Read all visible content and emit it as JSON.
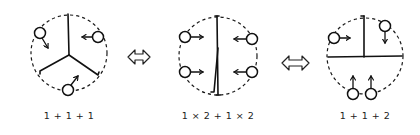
{
  "figure": {
    "colors": {
      "ink": "#111111",
      "background": "#ffffff"
    },
    "panels": [
      {
        "id": "panel-1",
        "label": "1 + 1 + 1",
        "partition": "three sectors (Y-shaped walls)",
        "agents": [
          {
            "x": 40,
            "y": 33,
            "direction": "down-right"
          },
          {
            "x": 98,
            "y": 37,
            "direction": "left"
          },
          {
            "x": 68,
            "y": 90,
            "direction": "up-right"
          }
        ]
      },
      {
        "id": "panel-2",
        "label": "1 × 2 + 1 × 2",
        "partition": "two halves (vertical wall)",
        "agents": [
          {
            "x": 185,
            "y": 37,
            "direction": "right"
          },
          {
            "x": 185,
            "y": 72,
            "direction": "right"
          },
          {
            "x": 252,
            "y": 39,
            "direction": "left"
          },
          {
            "x": 252,
            "y": 72,
            "direction": "left"
          }
        ]
      },
      {
        "id": "panel-3",
        "label": "1 + 1 + 2",
        "partition": "two quarters over one half (T-shaped walls)",
        "agents": [
          {
            "x": 334,
            "y": 38,
            "direction": "right"
          },
          {
            "x": 385,
            "y": 26,
            "direction": "down"
          },
          {
            "x": 353,
            "y": 94,
            "direction": "up"
          },
          {
            "x": 371,
            "y": 94,
            "direction": "up"
          }
        ]
      }
    ],
    "connectors": [
      {
        "id": "equiv-1",
        "symbol": "⇔",
        "between": [
          "panel-1",
          "panel-2"
        ]
      },
      {
        "id": "equiv-2",
        "symbol": "⇔",
        "between": [
          "panel-2",
          "panel-3"
        ]
      }
    ]
  }
}
